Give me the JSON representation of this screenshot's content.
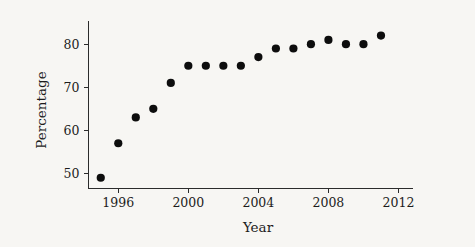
{
  "chart_data": {
    "type": "scatter",
    "title": "",
    "xlabel": "Year",
    "ylabel": "Percentage",
    "xlim": [
      1994.3,
      2012.8
    ],
    "ylim": [
      46.5,
      85.5
    ],
    "xticks": [
      1996,
      2000,
      2004,
      2008,
      2012
    ],
    "xtick_labels": [
      "1996",
      "2000",
      "2004",
      "2008",
      "2012"
    ],
    "yticks": [
      50,
      60,
      70,
      80
    ],
    "ytick_labels": [
      "50",
      "60",
      "70",
      "80"
    ],
    "grid": false,
    "legend": null,
    "marker": "filled-circle",
    "marker_color": "#0d0d0d",
    "background_color": "#f7f6f3",
    "axis_color": "#2b2b2b",
    "x": [
      1995,
      1996,
      1997,
      1998,
      1999,
      2000,
      2001,
      2002,
      2003,
      2004,
      2005,
      2006,
      2007,
      2008,
      2009,
      2010,
      2011
    ],
    "values": [
      49,
      57,
      63,
      65,
      71,
      75,
      75,
      75,
      75,
      77,
      79,
      79,
      80,
      81,
      80,
      80,
      82
    ],
    "points": [
      {
        "x": 1995,
        "y": 49
      },
      {
        "x": 1996,
        "y": 57
      },
      {
        "x": 1997,
        "y": 63
      },
      {
        "x": 1998,
        "y": 65
      },
      {
        "x": 1999,
        "y": 71
      },
      {
        "x": 2000,
        "y": 75
      },
      {
        "x": 2001,
        "y": 75
      },
      {
        "x": 2002,
        "y": 75
      },
      {
        "x": 2003,
        "y": 75
      },
      {
        "x": 2004,
        "y": 77
      },
      {
        "x": 2005,
        "y": 79
      },
      {
        "x": 2006,
        "y": 79
      },
      {
        "x": 2007,
        "y": 80
      },
      {
        "x": 2008,
        "y": 81
      },
      {
        "x": 2009,
        "y": 80
      },
      {
        "x": 2010,
        "y": 80
      },
      {
        "x": 2011,
        "y": 82
      }
    ]
  }
}
